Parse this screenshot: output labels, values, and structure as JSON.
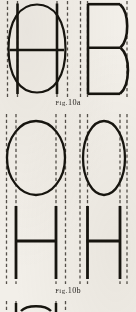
{
  "page": {
    "kind": "scanned-book-figure-page",
    "width": 136,
    "height": 312,
    "background_color": "#f2efe9",
    "ink_color": "#17150f",
    "guide_color": "#55504a"
  },
  "figures": [
    {
      "id": "fig-10a",
      "caption_prefix": "Fig.",
      "caption_number": "10a",
      "caption_text": "Fig. 10a",
      "subjects": [
        {
          "name": "wide-rounded-letterform-with-crossbar",
          "glyph": "wide O/H hybrid",
          "description": "Wide superelliptical bowl with two full-height vertical stems and one horizontal crossbar at mid height",
          "guide_lines": 4
        },
        {
          "name": "narrow-letterform-b",
          "glyph": "B",
          "description": "Narrow capital B with flat spine, two bowls and a mid-height junction bar",
          "guide_lines": 3
        }
      ]
    },
    {
      "id": "fig-10b",
      "caption_prefix": "Fig.",
      "caption_number": "10b",
      "caption_text": "Fig. 10b",
      "subjects": [
        {
          "name": "wide-o-bowl",
          "glyph": "O",
          "description": "Wide round capital O outline with dashed stem guides",
          "guide_lines": 4
        },
        {
          "name": "narrow-o-bowl",
          "glyph": "O",
          "description": "Narrow oval capital O outline with dashed stem guides",
          "guide_lines": 4
        },
        {
          "name": "wide-h-letter",
          "glyph": "H",
          "description": "Wide capital H with two vertical stems and mid crossbar",
          "guide_lines": 4
        },
        {
          "name": "narrow-h-letter",
          "glyph": "H",
          "description": "Narrow capital H with two vertical stems and mid crossbar",
          "guide_lines": 4
        }
      ]
    },
    {
      "id": "fig-next-cropped",
      "caption_text": "",
      "subjects": [
        {
          "name": "cropped-arc-figure",
          "glyph": "partial",
          "description": "Top sliver of the next figure cropped by the page edge",
          "guide_lines": 4
        }
      ]
    }
  ]
}
